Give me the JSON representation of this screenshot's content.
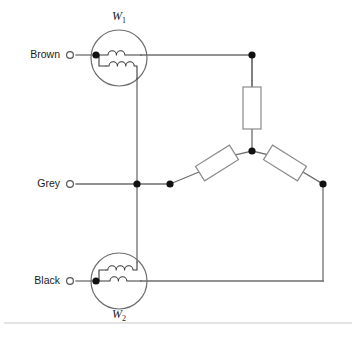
{
  "diagram": {
    "background_color": "#ffffff",
    "wire_color": "#6d6d6d",
    "node_color": "#111111",
    "rule_color": "#c9c9c9",
    "terminals": [
      {
        "id": "brown",
        "label": "Brown",
        "x": 68,
        "y": 55
      },
      {
        "id": "grey",
        "label": "Grey",
        "x": 68,
        "y": 184
      },
      {
        "id": "black",
        "label": "Black",
        "x": 68,
        "y": 281
      }
    ],
    "windings": [
      {
        "id": "w1",
        "label": "W",
        "subscript": "1",
        "label_position": "above",
        "cx": 119,
        "cy": 58,
        "r": 28,
        "coil_top_turns": 2,
        "coil_bottom_turns": 3
      },
      {
        "id": "w2",
        "label": "W",
        "subscript": "2",
        "label_position": "below",
        "cx": 119,
        "cy": 281,
        "r": 28,
        "coil_top_turns": 3,
        "coil_bottom_turns": 2
      }
    ],
    "resistors": [
      {
        "id": "r-top",
        "orientation": "vertical",
        "cx": 252,
        "cy": 108,
        "w": 18,
        "h": 42,
        "angle": 0
      },
      {
        "id": "r-left",
        "orientation": "diagonal",
        "cx": 217,
        "cy": 163,
        "w": 40,
        "h": 17,
        "angle": -32
      },
      {
        "id": "r-right",
        "orientation": "diagonal",
        "cx": 285,
        "cy": 163,
        "w": 40,
        "h": 17,
        "angle": 32
      }
    ],
    "nodes": [
      {
        "id": "n-brown-coil",
        "x": 96,
        "y": 55
      },
      {
        "id": "n-top-right",
        "x": 252,
        "y": 55
      },
      {
        "id": "n-star-center",
        "x": 252,
        "y": 151
      },
      {
        "id": "n-grey-main",
        "x": 137,
        "y": 184
      },
      {
        "id": "n-grey-branch",
        "x": 170,
        "y": 184
      },
      {
        "id": "n-right",
        "x": 323,
        "y": 184
      },
      {
        "id": "n-black-coil",
        "x": 96,
        "y": 281
      }
    ],
    "footer_rule": {
      "y": 323,
      "x1": 4,
      "x2": 352
    }
  }
}
